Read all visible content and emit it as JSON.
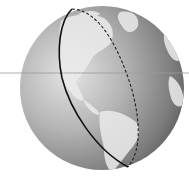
{
  "figure": {
    "colors": {
      "background": "#ffffff",
      "ocean_dark": "#6e6e6e",
      "ocean_light": "#d8d8d8",
      "land": "#e6e6e6",
      "great_circle": "#111111",
      "horizontal_line": "#9a9a9a"
    },
    "globe": {
      "cx": 102,
      "cy": 88,
      "r": 82
    },
    "horizontal_line": {
      "y": 73
    },
    "great_circle": {
      "front_style": "solid",
      "back_style": "dashed"
    }
  }
}
